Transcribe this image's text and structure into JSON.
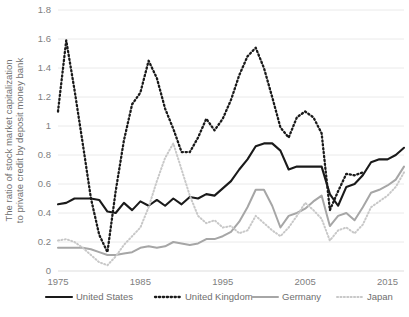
{
  "chart_data": {
    "type": "line",
    "title": "",
    "subtitle": "",
    "xlabel": "",
    "ylabel": "The ratio of stock market capitalization to private credit by deposit money bank",
    "xlim": [
      1975,
      2017
    ],
    "ylim": [
      0,
      1.8
    ],
    "grid": false,
    "legend_position": "bottom",
    "x_ticks": [
      "1975",
      "1985",
      "1995",
      "2005",
      "2015"
    ],
    "x_tick_values": [
      1975,
      1985,
      1995,
      2005,
      2015
    ],
    "y_ticks": [
      "0",
      "0.2",
      "0.4",
      "0.6",
      "0.8",
      "1",
      "1.2",
      "1.4",
      "1.6",
      "1.8"
    ],
    "y_tick_values": [
      0,
      0.2,
      0.4,
      0.6,
      0.8,
      1,
      1.2,
      1.4,
      1.6,
      1.8
    ],
    "series": [
      {
        "name": "United States",
        "color": "#1a1a1a",
        "style": "solid",
        "width": 2.1,
        "x": [
          1975,
          1976,
          1977,
          1978,
          1979,
          1980,
          1981,
          1982,
          1983,
          1984,
          1985,
          1986,
          1987,
          1988,
          1989,
          1990,
          1991,
          1992,
          1993,
          1994,
          1995,
          1996,
          1997,
          1998,
          1999,
          2000,
          2001,
          2002,
          2003,
          2004,
          2005,
          2006,
          2007,
          2008,
          2009,
          2010,
          2011,
          2012,
          2013,
          2014,
          2015,
          2016,
          2017
        ],
        "values": [
          0.46,
          0.47,
          0.5,
          0.5,
          0.5,
          0.49,
          0.41,
          0.4,
          0.47,
          0.42,
          0.48,
          0.45,
          0.49,
          0.45,
          0.5,
          0.46,
          0.51,
          0.5,
          0.53,
          0.52,
          0.57,
          0.62,
          0.7,
          0.77,
          0.86,
          0.88,
          0.88,
          0.83,
          0.7,
          0.72,
          0.72,
          0.72,
          0.72,
          0.53,
          0.45,
          0.58,
          0.6,
          0.66,
          0.75,
          0.77,
          0.77,
          0.8,
          0.85
        ]
      },
      {
        "name": "United Kingdom",
        "color": "#1a1a1a",
        "style": "dotted",
        "width": 2.3,
        "x": [
          1975,
          1976,
          1977,
          1978,
          1979,
          1980,
          1981,
          1982,
          1983,
          1984,
          1985,
          1986,
          1987,
          1988,
          1989,
          1990,
          1991,
          1992,
          1993,
          1994,
          1995,
          1996,
          1997,
          1998,
          1999,
          2000,
          2001,
          2002,
          2003,
          2004,
          2005,
          2006,
          2007,
          2008,
          2009,
          2010,
          2011,
          2012
        ],
        "values": [
          1.1,
          1.59,
          1.25,
          0.88,
          0.5,
          0.25,
          0.13,
          0.55,
          0.9,
          1.15,
          1.23,
          1.45,
          1.33,
          1.12,
          0.98,
          0.82,
          0.82,
          0.92,
          1.05,
          0.97,
          1.05,
          1.18,
          1.35,
          1.48,
          1.54,
          1.4,
          1.2,
          0.99,
          0.92,
          1.06,
          1.1,
          1.06,
          0.95,
          0.42,
          0.55,
          0.67,
          0.66,
          0.68
        ]
      },
      {
        "name": "Germany",
        "color": "#a6a6a6",
        "style": "solid",
        "width": 2.0,
        "x": [
          1975,
          1976,
          1977,
          1978,
          1979,
          1980,
          1981,
          1982,
          1983,
          1984,
          1985,
          1986,
          1987,
          1988,
          1989,
          1990,
          1991,
          1992,
          1993,
          1994,
          1995,
          1996,
          1997,
          1998,
          1999,
          2000,
          2001,
          2002,
          2003,
          2004,
          2005,
          2006,
          2007,
          2008,
          2009,
          2010,
          2011,
          2012,
          2013,
          2014,
          2015,
          2016,
          2017
        ],
        "values": [
          0.16,
          0.16,
          0.16,
          0.16,
          0.15,
          0.13,
          0.11,
          0.11,
          0.12,
          0.13,
          0.16,
          0.17,
          0.16,
          0.17,
          0.2,
          0.19,
          0.18,
          0.19,
          0.22,
          0.22,
          0.24,
          0.27,
          0.34,
          0.44,
          0.56,
          0.56,
          0.45,
          0.3,
          0.38,
          0.4,
          0.43,
          0.48,
          0.52,
          0.31,
          0.38,
          0.4,
          0.35,
          0.44,
          0.54,
          0.56,
          0.59,
          0.63,
          0.72
        ]
      },
      {
        "name": "Japan",
        "color": "#c8c8c8",
        "style": "dotted",
        "width": 2.0,
        "x": [
          1975,
          1976,
          1977,
          1978,
          1979,
          1980,
          1981,
          1982,
          1983,
          1984,
          1985,
          1986,
          1987,
          1988,
          1989,
          1990,
          1991,
          1992,
          1993,
          1994,
          1995,
          1996,
          1997,
          1998,
          1999,
          2000,
          2001,
          2002,
          2003,
          2004,
          2005,
          2006,
          2007,
          2008,
          2009,
          2010,
          2011,
          2012,
          2013,
          2014,
          2015,
          2016,
          2017
        ],
        "values": [
          0.21,
          0.22,
          0.2,
          0.16,
          0.11,
          0.06,
          0.04,
          0.1,
          0.18,
          0.24,
          0.3,
          0.44,
          0.62,
          0.78,
          0.88,
          0.7,
          0.52,
          0.38,
          0.33,
          0.35,
          0.3,
          0.31,
          0.26,
          0.28,
          0.38,
          0.33,
          0.28,
          0.24,
          0.3,
          0.38,
          0.47,
          0.42,
          0.36,
          0.21,
          0.28,
          0.3,
          0.26,
          0.32,
          0.44,
          0.48,
          0.52,
          0.58,
          0.68
        ]
      }
    ]
  }
}
